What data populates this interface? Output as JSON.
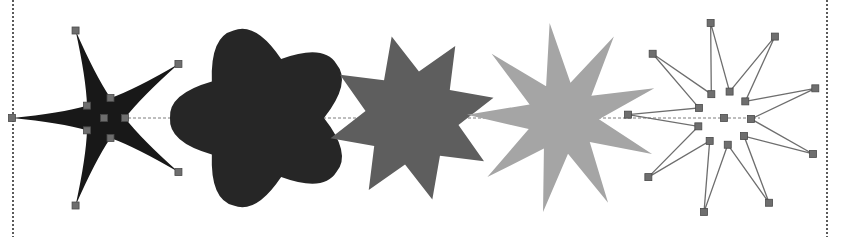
{
  "canvas": {
    "width": 843,
    "height": 237,
    "background": "#ffffff",
    "title": "Star shape variations with vertex handles"
  },
  "frame": {
    "left_rule_x": 12,
    "right_rule_x": 826,
    "rule_color": "#5a5a5a",
    "style": "dotted"
  },
  "baseline": {
    "label": "horizontal construction line",
    "y": 118,
    "x_start": 108,
    "x_end": 760,
    "color": "#7d7d7d"
  },
  "handles": {
    "label": "vertex handle",
    "size": 7,
    "fill": "#6e6e6e",
    "stroke": "#4a4a4a"
  },
  "shapes": [
    {
      "name": "star-5-point-thin",
      "points": 5,
      "fill": "#181818",
      "stroke": "none",
      "outlined": false,
      "center": {
        "x": 104,
        "y": 118
      },
      "outer_radius": 92,
      "inner_radius": 21,
      "rotation": -18,
      "spike_curve": 0.62,
      "description": "very thin tapered five-point star, solid black"
    },
    {
      "name": "star-5-point-blob",
      "points": 5,
      "fill": "#262626",
      "stroke": "none",
      "outlined": false,
      "center": {
        "x": 262,
        "y": 118
      },
      "outer_radius": 92,
      "inner_radius": 62,
      "rotation": -18,
      "spike_curve": -0.42,
      "description": "rounded blob star with five short tapered spikes, near black"
    },
    {
      "name": "star-8-point-medium",
      "points": 8,
      "fill": "#5e5e5e",
      "stroke": "none",
      "outlined": false,
      "center": {
        "x": 412,
        "y": 118
      },
      "outer_radius": 84,
      "inner_radius": 47,
      "rotation": -14,
      "spike_curve": 0,
      "description": "eight-point spiky star, medium gray"
    },
    {
      "name": "star-9-point-light",
      "points": 9,
      "fill": "#a5a5a5",
      "stroke": "none",
      "outlined": false,
      "center": {
        "x": 563,
        "y": 118
      },
      "outer_radius": 96,
      "inner_radius": 36,
      "rotation": -8,
      "spike_curve": 0,
      "description": "nine-point narrow star, light gray"
    },
    {
      "name": "star-9-point-wireframe",
      "points": 9,
      "fill": "none",
      "stroke": "#6e6e6e",
      "outlined": true,
      "center": {
        "x": 724,
        "y": 118
      },
      "outer_radius": 96,
      "inner_radius": 27,
      "rotation": -8,
      "spike_curve": 0,
      "description": "nine-point star drawn as outline wireframe with handles at every vertex"
    }
  ]
}
